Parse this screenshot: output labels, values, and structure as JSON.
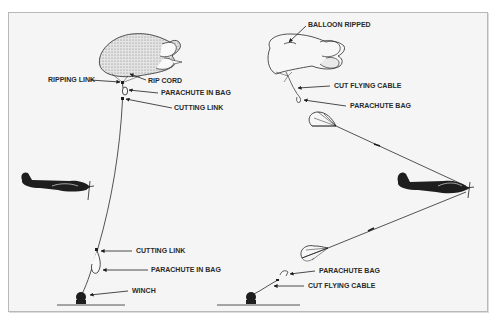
{
  "diagram": {
    "left_panel": {
      "labels": {
        "ripping_link": "RIPPING LINK",
        "rip_cord": "RIP CORD",
        "parachute_in_bag_top": "PARACHUTE IN BAG",
        "cutting_link_top": "CUTTING LINK",
        "cutting_link_bottom": "CUTTING LINK",
        "parachute_in_bag_bottom": "PARACHUTE IN BAG",
        "winch": "WINCH"
      }
    },
    "right_panel": {
      "labels": {
        "balloon_ripped": "BALLOON RIPPED",
        "cut_flying_cable_top": "CUT FLYING CABLE",
        "parachute_bag_top": "PARACHUTE BAG",
        "parachute_bag_bottom": "PARACHUTE BAG",
        "cut_flying_cable_bottom": "CUT FLYING CABLE"
      }
    },
    "colors": {
      "ink": "#1e1e1e",
      "background": "#f5f5f5",
      "frame": "#b9b9b9"
    }
  }
}
